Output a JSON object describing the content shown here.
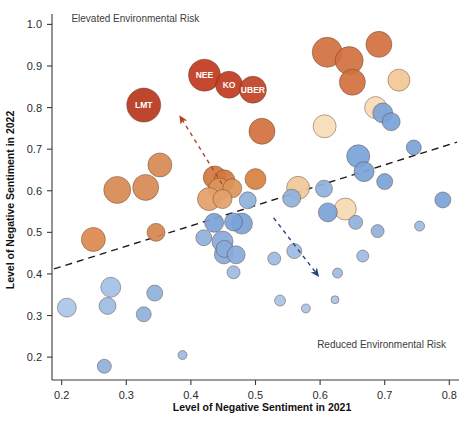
{
  "chart_data": {
    "type": "scatter",
    "title": "",
    "xlabel": "Level of Negative Sentiment in 2021",
    "ylabel": "Level of Negative Sentiment in 2022",
    "xlim": [
      0.185,
      0.815
    ],
    "ylim": [
      0.145,
      1.025
    ],
    "xticks": [
      "0.2",
      "0.3",
      "0.4",
      "0.5",
      "0.6",
      "0.7",
      "0.8"
    ],
    "xtick_values": [
      0.2,
      0.3,
      0.4,
      0.5,
      0.6,
      0.7,
      0.8
    ],
    "yticks": [
      "0.2",
      "0.3",
      "0.4",
      "0.5",
      "0.6",
      "0.7",
      "0.8",
      "0.9",
      "1.0"
    ],
    "ytick_values": [
      0.2,
      0.3,
      0.4,
      0.5,
      0.6,
      0.7,
      0.8,
      0.9,
      1.0
    ],
    "grid": false,
    "legend": "none",
    "annotations": [
      {
        "name": "elevated-risk-note",
        "text": "Elevated Environmental Risk",
        "x": 0.215,
        "y": 1.005,
        "anchor": "start"
      },
      {
        "name": "reduced-risk-note",
        "text": "Reduced Environmental Risk",
        "x": 0.795,
        "y": 0.222,
        "anchor": "end"
      }
    ],
    "trendline": {
      "name": "diagonal-trendline",
      "x0": 0.188,
      "y0": 0.412,
      "x1": 0.812,
      "y1": 0.717,
      "style": "dashed",
      "color": "#1c1c1c"
    },
    "arrows": [
      {
        "name": "upward-risk-arrow",
        "color": "#b0452b",
        "x0": 0.448,
        "y0": 0.617,
        "x1": 0.386,
        "y1": 0.772
      },
      {
        "name": "downward-risk-arrow",
        "color": "#27487f",
        "x0": 0.528,
        "y0": 0.535,
        "x1": 0.594,
        "y1": 0.402
      }
    ],
    "points": [
      {
        "label": "LMT",
        "x": 0.327,
        "y": 0.806,
        "r": 17.0,
        "color": "#b8381f"
      },
      {
        "label": "NEE",
        "x": 0.421,
        "y": 0.878,
        "r": 16.0,
        "color": "#bf3b20"
      },
      {
        "label": "KO",
        "x": 0.459,
        "y": 0.855,
        "r": 13.5,
        "color": "#bf3b20"
      },
      {
        "label": "UBER",
        "x": 0.496,
        "y": 0.843,
        "r": 13.5,
        "color": "#c04326"
      },
      {
        "label": "",
        "x": 0.611,
        "y": 0.933,
        "r": 15.0,
        "color": "#d2713f"
      },
      {
        "label": "",
        "x": 0.645,
        "y": 0.913,
        "r": 14.0,
        "color": "#d2713f"
      },
      {
        "label": "",
        "x": 0.691,
        "y": 0.952,
        "r": 13.0,
        "color": "#d2713f"
      },
      {
        "label": "",
        "x": 0.65,
        "y": 0.861,
        "r": 13.0,
        "color": "#d2713f"
      },
      {
        "label": "",
        "x": 0.51,
        "y": 0.743,
        "r": 13.0,
        "color": "#d2713f"
      },
      {
        "label": "",
        "x": 0.286,
        "y": 0.602,
        "r": 13.5,
        "color": "#d88a55"
      },
      {
        "label": "",
        "x": 0.33,
        "y": 0.608,
        "r": 13.0,
        "color": "#d88a55"
      },
      {
        "label": "",
        "x": 0.352,
        "y": 0.662,
        "r": 12.0,
        "color": "#d88a55"
      },
      {
        "label": "",
        "x": 0.249,
        "y": 0.483,
        "r": 12.0,
        "color": "#dd8a50"
      },
      {
        "label": "",
        "x": 0.346,
        "y": 0.5,
        "r": 9.0,
        "color": "#d5864f"
      },
      {
        "label": "",
        "x": 0.437,
        "y": 0.632,
        "r": 11.5,
        "color": "#d3793f"
      },
      {
        "label": "",
        "x": 0.452,
        "y": 0.625,
        "r": 10.5,
        "color": "#d3793f"
      },
      {
        "label": "",
        "x": 0.444,
        "y": 0.604,
        "r": 11.0,
        "color": "#dd9458"
      },
      {
        "label": "",
        "x": 0.464,
        "y": 0.606,
        "r": 9.5,
        "color": "#dd9458"
      },
      {
        "label": "",
        "x": 0.428,
        "y": 0.58,
        "r": 11.5,
        "color": "#e3a06c"
      },
      {
        "label": "",
        "x": 0.449,
        "y": 0.58,
        "r": 9.5,
        "color": "#e3a06c"
      },
      {
        "label": "",
        "x": 0.5,
        "y": 0.628,
        "r": 10.5,
        "color": "#d8813f"
      },
      {
        "label": "",
        "x": 0.566,
        "y": 0.607,
        "r": 11.5,
        "color": "#f0c79a"
      },
      {
        "label": "",
        "x": 0.607,
        "y": 0.755,
        "r": 11.5,
        "color": "#f8ddb8"
      },
      {
        "label": "",
        "x": 0.639,
        "y": 0.556,
        "r": 11.0,
        "color": "#f6d9b2"
      },
      {
        "label": "",
        "x": 0.686,
        "y": 0.8,
        "r": 11.0,
        "color": "#f7dcb6"
      },
      {
        "label": "",
        "x": 0.722,
        "y": 0.866,
        "r": 11.0,
        "color": "#f2c795"
      },
      {
        "label": "",
        "x": 0.659,
        "y": 0.683,
        "r": 11.5,
        "color": "#7ba3d8"
      },
      {
        "label": "",
        "x": 0.668,
        "y": 0.646,
        "r": 10.0,
        "color": "#7ba3d8"
      },
      {
        "label": "",
        "x": 0.697,
        "y": 0.787,
        "r": 10.0,
        "color": "#7ba3d8"
      },
      {
        "label": "",
        "x": 0.71,
        "y": 0.766,
        "r": 9.0,
        "color": "#7ba3d8"
      },
      {
        "label": "",
        "x": 0.7,
        "y": 0.622,
        "r": 8.0,
        "color": "#7ba3d8"
      },
      {
        "label": "",
        "x": 0.745,
        "y": 0.704,
        "r": 7.5,
        "color": "#7ba3d8"
      },
      {
        "label": "",
        "x": 0.79,
        "y": 0.578,
        "r": 8.0,
        "color": "#7ba3d8"
      },
      {
        "label": "",
        "x": 0.754,
        "y": 0.515,
        "r": 5.0,
        "color": "#9dbbe2"
      },
      {
        "label": "",
        "x": 0.689,
        "y": 0.503,
        "r": 6.5,
        "color": "#8fb1dd"
      },
      {
        "label": "",
        "x": 0.666,
        "y": 0.443,
        "r": 6.0,
        "color": "#9dbbe2"
      },
      {
        "label": "",
        "x": 0.655,
        "y": 0.524,
        "r": 7.0,
        "color": "#8fb1dd"
      },
      {
        "label": "",
        "x": 0.612,
        "y": 0.548,
        "r": 9.5,
        "color": "#7ba3d8"
      },
      {
        "label": "",
        "x": 0.606,
        "y": 0.605,
        "r": 8.5,
        "color": "#8fb1dd"
      },
      {
        "label": "",
        "x": 0.56,
        "y": 0.455,
        "r": 7.5,
        "color": "#9dbbe2"
      },
      {
        "label": "",
        "x": 0.556,
        "y": 0.582,
        "r": 9.0,
        "color": "#8fb1dd"
      },
      {
        "label": "",
        "x": 0.488,
        "y": 0.577,
        "r": 8.5,
        "color": "#8fb1dd"
      },
      {
        "label": "",
        "x": 0.479,
        "y": 0.521,
        "r": 10.5,
        "color": "#7ba3d8"
      },
      {
        "label": "",
        "x": 0.466,
        "y": 0.525,
        "r": 9.0,
        "color": "#7ba3d8"
      },
      {
        "label": "",
        "x": 0.449,
        "y": 0.478,
        "r": 10.5,
        "color": "#88abdb"
      },
      {
        "label": "",
        "x": 0.451,
        "y": 0.447,
        "r": 9.5,
        "color": "#88abdb"
      },
      {
        "label": "",
        "x": 0.452,
        "y": 0.46,
        "r": 8.5,
        "color": "#88abdb"
      },
      {
        "label": "",
        "x": 0.47,
        "y": 0.446,
        "r": 9.0,
        "color": "#88abdb"
      },
      {
        "label": "",
        "x": 0.436,
        "y": 0.523,
        "r": 9.5,
        "color": "#7ba3d8"
      },
      {
        "label": "",
        "x": 0.42,
        "y": 0.487,
        "r": 8.0,
        "color": "#8fb1dd"
      },
      {
        "label": "",
        "x": 0.529,
        "y": 0.437,
        "r": 6.5,
        "color": "#9dbbe2"
      },
      {
        "label": "",
        "x": 0.538,
        "y": 0.336,
        "r": 5.5,
        "color": "#a9c4e6"
      },
      {
        "label": "",
        "x": 0.578,
        "y": 0.317,
        "r": 4.5,
        "color": "#a9c4e6"
      },
      {
        "label": "",
        "x": 0.623,
        "y": 0.338,
        "r": 4.0,
        "color": "#a9c4e6"
      },
      {
        "label": "",
        "x": 0.627,
        "y": 0.402,
        "r": 5.0,
        "color": "#9dbbe2"
      },
      {
        "label": "",
        "x": 0.208,
        "y": 0.319,
        "r": 9.5,
        "color": "#aac6e8"
      },
      {
        "label": "",
        "x": 0.276,
        "y": 0.368,
        "r": 10.0,
        "color": "#a5c1e6"
      },
      {
        "label": "",
        "x": 0.271,
        "y": 0.323,
        "r": 8.5,
        "color": "#9dbbe2"
      },
      {
        "label": "",
        "x": 0.266,
        "y": 0.178,
        "r": 7.0,
        "color": "#8fb1dd"
      },
      {
        "label": "",
        "x": 0.327,
        "y": 0.303,
        "r": 7.5,
        "color": "#8fb1dd"
      },
      {
        "label": "",
        "x": 0.344,
        "y": 0.354,
        "r": 8.0,
        "color": "#8fb1dd"
      },
      {
        "label": "",
        "x": 0.387,
        "y": 0.205,
        "r": 4.5,
        "color": "#9dbbe2"
      },
      {
        "label": "",
        "x": 0.466,
        "y": 0.404,
        "r": 6.5,
        "color": "#9dbbe2"
      }
    ]
  },
  "axes": {
    "x_title": "Level of Negative Sentiment in 2021",
    "y_title": "Level of Negative Sentiment in 2022"
  },
  "colors": {
    "high_risk": "#b8381f",
    "mid_orange": "#d2713f",
    "light_orange": "#f2c795",
    "blue": "#7ba3d8",
    "light_blue": "#a9c4e6",
    "axis": "#3a3a3a",
    "trendline": "#1c1c1c",
    "arrow_up": "#b0452b",
    "arrow_down": "#27487f",
    "background": "#ffffff"
  }
}
